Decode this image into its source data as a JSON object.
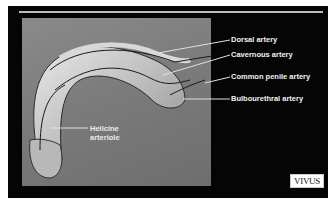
{
  "labels": {
    "dorsal": "Dorsal artery",
    "cavernous": "Cavernous artery",
    "common_penile": "Common penile artery",
    "bulbourethral": "Bulbourethral artery",
    "helicine_line1": "Helicine",
    "helicine_line2": "arteriole"
  },
  "logo": "VIVUS",
  "colors": {
    "background": "#050505",
    "panel": "#7a7a7a",
    "label_text": "#f2f2f2"
  }
}
